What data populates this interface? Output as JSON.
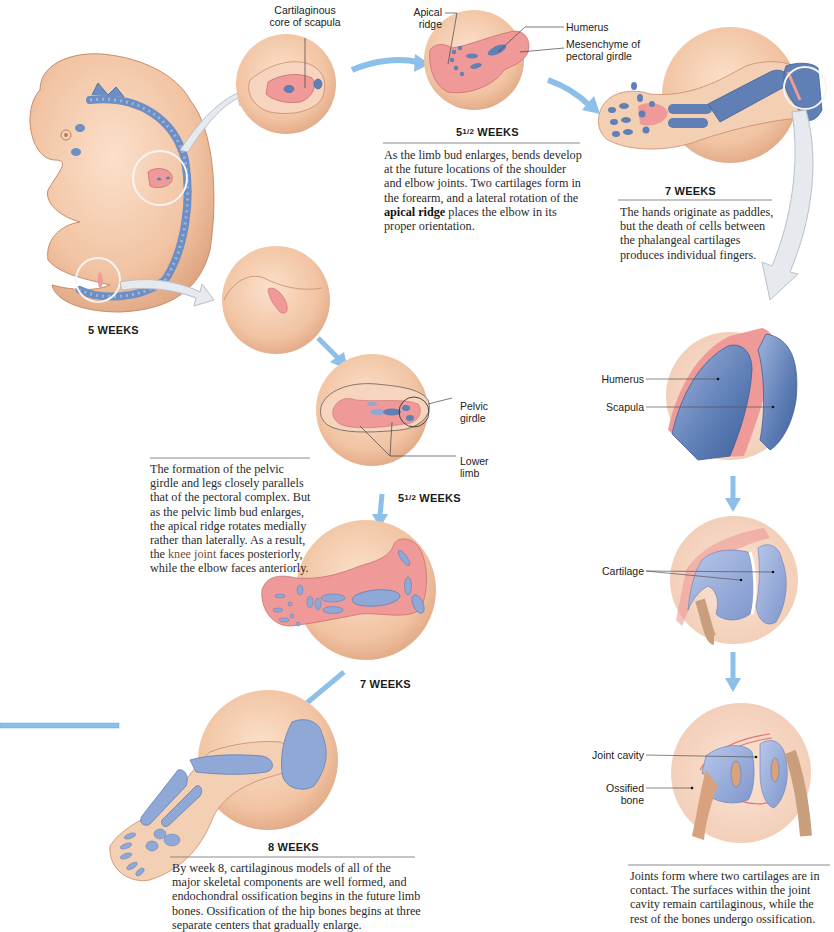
{
  "stages": {
    "s5w": {
      "title": "5 WEEKS"
    },
    "upper_55w": {
      "title_num": "5",
      "title_frac": "1/2",
      "title_rest": "WEEKS"
    },
    "upper_7w": {
      "title": "7 WEEKS"
    },
    "lower_55w": {
      "title_num": "5",
      "title_frac": "1/2",
      "title_rest": "WEEKS"
    },
    "lower_7w": {
      "title": "7 WEEKS"
    },
    "lower_8w": {
      "title": "8 WEEKS"
    }
  },
  "labels": {
    "cartilaginous_core_line1": "Cartilaginous",
    "cartilaginous_core_line2": "core of scapula",
    "apical_ridge_line1": "Apical",
    "apical_ridge_line2": "ridge",
    "humerus_top": "Humerus",
    "mesenchyme_line1": "Mesenchyme of",
    "mesenchyme_line2": "pectoral girdle",
    "pelvic_girdle_line1": "Pelvic",
    "pelvic_girdle_line2": "girdle",
    "lower_limb_line1": "Lower",
    "lower_limb_line2": "limb",
    "humerus_joint": "Humerus",
    "scapula_joint": "Scapula",
    "cartilage": "Cartilage",
    "joint_cavity": "Joint cavity",
    "ossified_line1": "Ossified",
    "ossified_line2": "bone"
  },
  "captions": {
    "upper_55w": {
      "pre": "As the limb bud enlarges, bends develop at the future locations of the shoulder and elbow joints. Two cartilages form in the forearm, and a lateral rotation of the ",
      "bold": "apical ridge",
      "post": " places the elbow in its proper orientation."
    },
    "upper_7w": "The hands originate as paddles, but the death of cells between the phalangeal cartilages produces individual fingers.",
    "lower_55w": {
      "pre": "The formation of the pelvic girdle and legs closely parallels that of the pectoral complex. But as the pelvic limb bud enlarges, the apical ridge rotates medially rather than laterally. As a result, the ",
      "highlight": "knee joint",
      "post": " faces posteriorly, while the elbow faces anteriorly."
    },
    "lower_8w": "By week 8, cartilaginous models of all of the major skeletal components are well formed, and endochondral ossification begins in the future limb bones. Ossification of the hip bones begins at three separate centers that gradually enlarge.",
    "joints": "Joints form where two cartilages are in contact. The surfaces within the joint cavity remain cartilaginous, while the rest of the bones undergo ossification."
  },
  "colors": {
    "skin": "#f2c7a6",
    "skin_dark": "#d9a27f",
    "cartilage_pink": "#ef9a98",
    "bone_blue": "#5f7fb5",
    "light_blue": "#8fa8d6",
    "arrow_blue": "#8cc0ea",
    "arrow_gray": "#dfe5ec"
  }
}
